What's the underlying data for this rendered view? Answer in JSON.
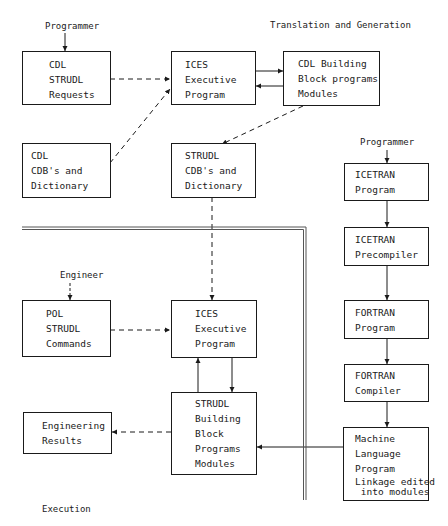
{
  "diagram": {
    "section_labels": {
      "translation": "Translation and Generation",
      "execution": "Execution"
    },
    "actors": {
      "programmer_top": "Programmer",
      "programmer_right": "Programmer",
      "engineer": "Engineer"
    },
    "nodes": {
      "cdl_strudl_requests": {
        "lines": [
          "CDL",
          "STRUDL",
          "Requests"
        ]
      },
      "ices_exec_top": {
        "lines": [
          "ICES",
          "Executive",
          "Program"
        ]
      },
      "cdl_building_block": {
        "lines": [
          "CDL Building",
          "Block programs",
          "Modules"
        ]
      },
      "cdl_cdbs": {
        "lines": [
          "CDL",
          "CDB's and",
          "Dictionary"
        ]
      },
      "strudl_cdbs": {
        "lines": [
          "STRUDL",
          "CDB's and",
          "Dictionary"
        ]
      },
      "icetran_program": {
        "lines": [
          "ICETRAN",
          "Program"
        ]
      },
      "icetran_precompiler": {
        "lines": [
          "ICETRAN",
          "Precompiler"
        ]
      },
      "fortran_program": {
        "lines": [
          "FORTRAN",
          "Program"
        ]
      },
      "fortran_compiler": {
        "lines": [
          "FORTRAN",
          "Compiler"
        ]
      },
      "machine_language": {
        "lines": [
          "Machine",
          "Language",
          "Program",
          "Linkage edited",
          " into modules"
        ]
      },
      "pol_strudl_commands": {
        "lines": [
          "POL",
          "STRUDL",
          "Commands"
        ]
      },
      "ices_exec_bottom": {
        "lines": [
          "ICES",
          "Executive",
          "Program"
        ]
      },
      "strudl_building_block": {
        "lines": [
          "STRUDL",
          "Building",
          "Block",
          "Programs",
          "Modules"
        ]
      },
      "engineering_results": {
        "lines": [
          "Engineering",
          "Results"
        ]
      }
    },
    "edges": [
      {
        "from": "Programmer",
        "to": "cdl_strudl_requests",
        "style": "solid"
      },
      {
        "from": "cdl_strudl_requests",
        "to": "ices_exec_top",
        "style": "dashed"
      },
      {
        "from": "cdl_cdbs",
        "to": "ices_exec_top",
        "style": "dashed"
      },
      {
        "from": "ices_exec_top",
        "to": "cdl_building_block",
        "style": "solid"
      },
      {
        "from": "cdl_building_block",
        "to": "ices_exec_top",
        "style": "solid"
      },
      {
        "from": "cdl_building_block",
        "to": "strudl_cdbs",
        "style": "dashed"
      },
      {
        "from": "strudl_cdbs",
        "to": "ices_exec_bottom",
        "style": "dashed"
      },
      {
        "from": "Programmer",
        "to": "icetran_program",
        "style": "solid"
      },
      {
        "from": "icetran_program",
        "to": "icetran_precompiler",
        "style": "solid"
      },
      {
        "from": "icetran_precompiler",
        "to": "fortran_program",
        "style": "solid"
      },
      {
        "from": "fortran_program",
        "to": "fortran_compiler",
        "style": "solid"
      },
      {
        "from": "fortran_compiler",
        "to": "machine_language",
        "style": "solid"
      },
      {
        "from": "machine_language",
        "to": "strudl_building_block",
        "style": "solid"
      },
      {
        "from": "Engineer",
        "to": "pol_strudl_commands",
        "style": "dashed"
      },
      {
        "from": "pol_strudl_commands",
        "to": "ices_exec_bottom",
        "style": "dashed"
      },
      {
        "from": "ices_exec_bottom",
        "to": "strudl_building_block",
        "style": "solid"
      },
      {
        "from": "strudl_building_block",
        "to": "ices_exec_bottom",
        "style": "solid"
      },
      {
        "from": "strudl_building_block",
        "to": "engineering_results",
        "style": "dashed"
      }
    ]
  }
}
